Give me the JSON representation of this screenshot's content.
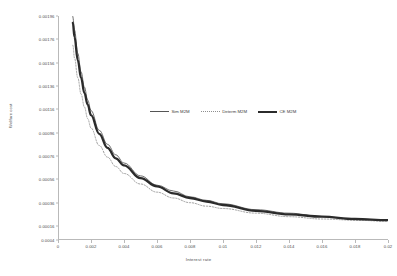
{
  "chart": {
    "type": "line",
    "title": "",
    "xlabel": "Interest rate",
    "ylabel": "Welfare cost"
  },
  "legend": {
    "position": "upper-center",
    "items": [
      {
        "label": "Sim M2M",
        "color": "#555555",
        "style": "solid-thin"
      },
      {
        "label": "Determ M2M",
        "color": "#8e8e8e",
        "style": "dotted"
      },
      {
        "label": "CE M2M",
        "color": "#2b2b2b",
        "style": "solid-thick"
      }
    ]
  },
  "axes": {
    "x": {
      "ticks": [
        "0",
        "0.002",
        "0.004",
        "0.006",
        "0.008",
        "0.01",
        "0.012",
        "0.014",
        "0.016",
        "0.018",
        "0.02"
      ],
      "values": [
        0,
        0.002,
        0.004,
        0.006,
        0.008,
        0.01,
        0.012,
        0.014,
        0.016,
        0.018,
        0.02
      ],
      "min": 0,
      "max": 0.02
    },
    "y": {
      "ticks": [
        "0.00196",
        "0.00176",
        "0.00156",
        "0.00136",
        "0.00116",
        "0.00096",
        "0.00076",
        "0.00056",
        "0.00036",
        "0.00016",
        "0.0004"
      ],
      "values": [
        0.00196,
        0.00176,
        0.00156,
        0.00136,
        0.00116,
        0.00096,
        0.00076,
        0.00056,
        0.00036,
        0.00016,
        4e-05
      ],
      "min": 4e-05,
      "max": 0.00196
    },
    "grid": false
  },
  "chart_data": {
    "type": "line",
    "title": "",
    "xlabel": "Interest rate",
    "ylabel": "Welfare cost",
    "xlim": [
      0,
      0.02
    ],
    "ylim": [
      4e-05,
      0.00196
    ],
    "grid": false,
    "legend_position": "upper-center",
    "x": [
      0.0009,
      0.001,
      0.0012,
      0.0014,
      0.0016,
      0.0018,
      0.002,
      0.0025,
      0.003,
      0.0035,
      0.004,
      0.005,
      0.006,
      0.007,
      0.008,
      0.009,
      0.01,
      0.012,
      0.014,
      0.016,
      0.018,
      0.02
    ],
    "series": [
      {
        "name": "Sim M2M",
        "color": "#555555",
        "style": "solid-thin",
        "values": [
          0.00196,
          0.00184,
          0.00164,
          0.00148,
          0.00135,
          0.00124,
          0.00115,
          0.00098,
          0.00086,
          0.00077,
          0.0007,
          0.00059,
          0.00051,
          0.00046,
          0.00041,
          0.00038,
          0.00035,
          0.0003,
          0.00027,
          0.00024,
          0.00022,
          0.00021
        ]
      },
      {
        "name": "Determ M2M",
        "color": "#8e8e8e",
        "style": "dotted",
        "values": [
          0.00171,
          0.0016,
          0.00143,
          0.00129,
          0.00118,
          0.00108,
          0.001,
          0.00085,
          0.00075,
          0.00067,
          0.00061,
          0.00052,
          0.00045,
          0.0004,
          0.00036,
          0.00033,
          0.00031,
          0.00027,
          0.00024,
          0.00022,
          0.00021,
          0.0002
        ]
      },
      {
        "name": "CE M2M",
        "color": "#2b2b2b",
        "style": "solid-thick",
        "values": [
          0.0019,
          0.00178,
          0.00158,
          0.00143,
          0.0013,
          0.0012,
          0.00111,
          0.00095,
          0.00083,
          0.00074,
          0.00068,
          0.00057,
          0.0005,
          0.00044,
          0.0004,
          0.00037,
          0.00034,
          0.00029,
          0.00026,
          0.00024,
          0.00022,
          0.00021
        ]
      }
    ]
  }
}
